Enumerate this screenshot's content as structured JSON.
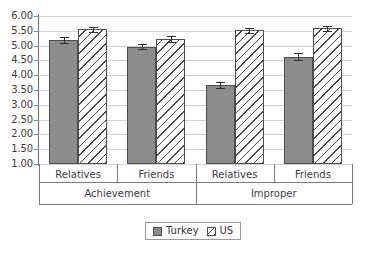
{
  "chart_data": {
    "type": "bar",
    "title": "",
    "subtitle": "",
    "xlabel": "",
    "ylabel": "",
    "ylim": [
      1.0,
      6.0
    ],
    "ytick_labels": [
      "6.00",
      "5.50",
      "5.00",
      "4.50",
      "4.00",
      "3.50",
      "3.00",
      "2.50",
      "2.00",
      "1.50",
      "1.00"
    ],
    "ytick_values": [
      6.0,
      5.5,
      5.0,
      4.5,
      4.0,
      3.5,
      3.0,
      2.5,
      2.0,
      1.5,
      1.0
    ],
    "grid": true,
    "legend_position": "bottom",
    "group_labels": [
      "Achievement",
      "Improper"
    ],
    "categories": [
      "Relatives",
      "Friends",
      "Relatives",
      "Friends"
    ],
    "category_groups": [
      {
        "group": "Achievement",
        "categories": [
          "Relatives",
          "Friends"
        ]
      },
      {
        "group": "Improper",
        "categories": [
          "Relatives",
          "Friends"
        ]
      }
    ],
    "series": [
      {
        "name": "Turkey",
        "values": [
          5.18,
          4.97,
          3.68,
          4.63
        ],
        "errors": [
          0.1,
          0.1,
          0.1,
          0.12
        ],
        "fill": "solid-gray",
        "color": "#8c8c8c"
      },
      {
        "name": "US",
        "values": [
          5.55,
          5.22,
          5.52,
          5.58
        ],
        "errors": [
          0.09,
          0.1,
          0.08,
          0.09
        ],
        "fill": "diagonal-hatch",
        "color": "#ffffff"
      }
    ]
  },
  "legend": {
    "items": [
      {
        "label": "Turkey",
        "swatch": "solid-gray-swatch"
      },
      {
        "label": "US",
        "swatch": "hatched-swatch"
      }
    ]
  },
  "axis": {
    "y_ticks": [
      "6.00",
      "5.50",
      "5.00",
      "4.50",
      "4.00",
      "3.50",
      "3.00",
      "2.50",
      "2.00",
      "1.50",
      "1.00"
    ]
  },
  "colors": {
    "turkey_fill": "#8c8c8c",
    "us_fill": "#ffffff",
    "hatch": "#4a4a4a",
    "bar_border": "#4d4d4d",
    "gridline": "#d2d2d2",
    "axis": "#6f6f6f",
    "text": "#3b3b3b"
  }
}
